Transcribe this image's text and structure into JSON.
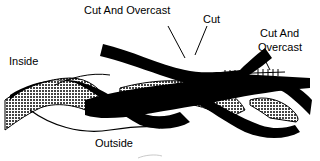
{
  "diagram": {
    "labels": {
      "cut_and_overcast_top": "Cut And Overcast",
      "cut": "Cut",
      "cut_and_overcast_right_line1": "Cut And",
      "cut_and_overcast_right_line2": "Overcast",
      "inside": "Inside",
      "outside": "Outside"
    },
    "colors": {
      "strand_dark": "#000000",
      "strand_light": "#ffffff",
      "strand_hatched": "#6a6a6a",
      "background": "#ffffff"
    }
  }
}
